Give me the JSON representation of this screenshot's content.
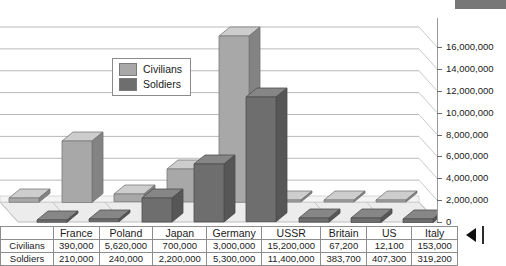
{
  "chart_data": {
    "type": "bar",
    "title": "",
    "subtitle": "",
    "xlabel": "",
    "ylabel": "",
    "categories": [
      "France",
      "Poland",
      "Japan",
      "Germany",
      "USSR",
      "Britain",
      "US",
      "Italy"
    ],
    "series": [
      {
        "name": "Civilians",
        "color": "#a8a8a8",
        "values": [
          390000,
          5620000,
          700000,
          3000000,
          15200000,
          67200,
          12100,
          153000
        ],
        "value_labels": [
          "390,000",
          "5,620,000",
          "700,000",
          "3,000,000",
          "15,200,000",
          "67,200",
          "12,100",
          "153,000"
        ]
      },
      {
        "name": "Soldiers",
        "color": "#6e6e6e",
        "values": [
          210000,
          240000,
          2200000,
          5300000,
          11400000,
          383700,
          407300,
          319200
        ],
        "value_labels": [
          "210,000",
          "240,000",
          "2,200,000",
          "5,300,000",
          "11,400,000",
          "383,700",
          "407,300",
          "319,200"
        ]
      }
    ],
    "ylim": [
      0,
      16000000
    ],
    "ytick_values": [
      0,
      2000000,
      4000000,
      6000000,
      8000000,
      10000000,
      12000000,
      14000000,
      16000000
    ],
    "ytick_labels": [
      "0",
      "2,000,000",
      "4,000,000",
      "6,000,000",
      "8,000,000",
      "10,000,000",
      "12,000,000",
      "14,000,000",
      "16,000,000"
    ],
    "grid": true,
    "legend_position": "inside-upper-left",
    "three_d": true
  },
  "legend": {
    "items": [
      {
        "label": "Civilians",
        "color": "#a8a8a8"
      },
      {
        "label": "Soldiers",
        "color": "#6e6e6e"
      }
    ]
  },
  "data_table": {
    "row_headers": [
      "Civilians",
      "Soldiers"
    ],
    "columns": [
      "France",
      "Poland",
      "Japan",
      "Germany",
      "USSR",
      "Britain",
      "US",
      "Italy"
    ],
    "rows": [
      [
        "390,000",
        "5,620,000",
        "700,000",
        "3,000,000",
        "15,200,000",
        "67,200",
        "12,100",
        "153,000"
      ],
      [
        "210,000",
        "240,000",
        "2,200,000",
        "5,300,000",
        "11,400,000",
        "383,700",
        "407,300",
        "319,200"
      ]
    ]
  },
  "colors": {
    "civilians": "#a8a8a8",
    "soldiers": "#6e6e6e",
    "gridline": "#b9b9b9",
    "floor": "#e9e9e9",
    "text": "#1a1a1a"
  }
}
